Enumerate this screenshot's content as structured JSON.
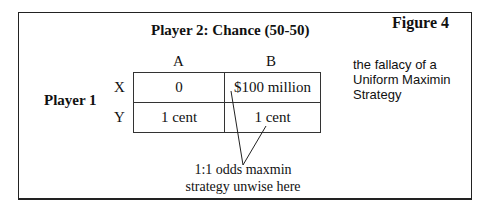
{
  "figure": {
    "label": "Figure 4",
    "caption": [
      "the fallacy of a",
      "Uniform Maximin",
      "Strategy"
    ]
  },
  "matrix": {
    "column_player": "Player 2: Chance (50-50)",
    "row_player": "Player 1",
    "columns": [
      "A",
      "B"
    ],
    "rows": [
      {
        "label": "X",
        "cells": [
          "0",
          "$100 million"
        ]
      },
      {
        "label": "Y",
        "cells": [
          "1 cent",
          "1 cent"
        ]
      }
    ]
  },
  "annotation": {
    "lines": [
      "1:1 odds maxmin",
      "strategy unwise here"
    ]
  }
}
